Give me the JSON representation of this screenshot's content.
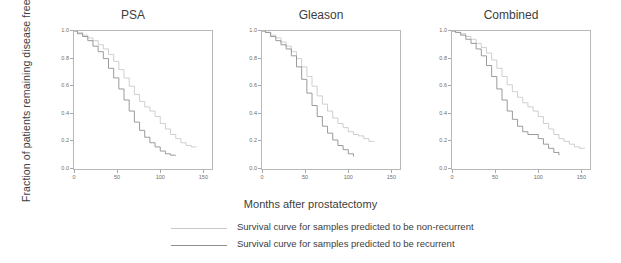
{
  "figure": {
    "ylabel": "Fraction of patients remaining disease free",
    "xlabel": "Months after prostatectomy"
  },
  "legend": {
    "entries": [
      {
        "label": "Survival curve for samples predicted to be non-recurrent",
        "color": "#c9c9c9",
        "key": "non-recurrent"
      },
      {
        "label": "Survival curve for samples predicted to be recurrent",
        "color": "#8e8e8e",
        "key": "recurrent"
      }
    ]
  },
  "chart_data": {
    "type": "line",
    "title": "",
    "xlabel": "Months after prostatectomy",
    "ylabel": "Fraction of patients remaining disease free",
    "xlim": [
      0,
      160
    ],
    "ylim": [
      0,
      1.0
    ],
    "xticks": [
      0,
      50,
      100,
      150
    ],
    "xticklabels": [
      "0",
      "50",
      "100",
      "150"
    ],
    "yticks": [
      0.0,
      0.2,
      0.4,
      0.6,
      0.8,
      1.0
    ],
    "yticklabels": [
      "0.0",
      "0.2",
      "0.4",
      "0.6",
      "0.8",
      "1.0"
    ],
    "grid": false,
    "legend_position": "bottom",
    "panels": [
      {
        "title": "PSA",
        "annotation": "p=0.0065937",
        "series": [
          {
            "name": "non-recurrent",
            "color": "#c9c9c9",
            "x": [
              0,
              4,
              10,
              16,
              22,
              28,
              34,
              40,
              46,
              52,
              58,
              64,
              70,
              76,
              82,
              88,
              94,
              100,
              106,
              112,
              118,
              124,
              130,
              136,
              142
            ],
            "y": [
              1.0,
              0.99,
              0.97,
              0.95,
              0.93,
              0.9,
              0.87,
              0.83,
              0.78,
              0.72,
              0.66,
              0.6,
              0.54,
              0.49,
              0.45,
              0.42,
              0.38,
              0.33,
              0.29,
              0.25,
              0.22,
              0.19,
              0.17,
              0.16,
              0.16
            ]
          },
          {
            "name": "recurrent",
            "color": "#8e8e8e",
            "x": [
              0,
              4,
              10,
              16,
              22,
              28,
              34,
              40,
              46,
              52,
              58,
              64,
              70,
              76,
              82,
              88,
              94,
              100,
              106,
              112,
              118
            ],
            "y": [
              1.0,
              0.98,
              0.96,
              0.93,
              0.89,
              0.85,
              0.8,
              0.73,
              0.66,
              0.58,
              0.5,
              0.42,
              0.34,
              0.28,
              0.23,
              0.19,
              0.16,
              0.13,
              0.11,
              0.1,
              0.1
            ]
          }
        ]
      },
      {
        "title": "Gleason",
        "annotation": "p=0.0095472",
        "series": [
          {
            "name": "non-recurrent",
            "color": "#c9c9c9",
            "x": [
              0,
              4,
              10,
              16,
              22,
              28,
              34,
              40,
              46,
              52,
              58,
              64,
              70,
              76,
              82,
              88,
              94,
              100,
              106,
              112,
              118,
              124,
              130
            ],
            "y": [
              1.0,
              0.99,
              0.97,
              0.95,
              0.92,
              0.89,
              0.85,
              0.8,
              0.74,
              0.67,
              0.6,
              0.53,
              0.47,
              0.42,
              0.37,
              0.33,
              0.3,
              0.27,
              0.25,
              0.24,
              0.22,
              0.2,
              0.2
            ]
          },
          {
            "name": "recurrent",
            "color": "#8e8e8e",
            "x": [
              0,
              4,
              10,
              16,
              22,
              28,
              34,
              40,
              46,
              52,
              58,
              64,
              70,
              76,
              82,
              88,
              94,
              100,
              106
            ],
            "y": [
              1.0,
              0.99,
              0.96,
              0.93,
              0.9,
              0.87,
              0.82,
              0.74,
              0.65,
              0.55,
              0.46,
              0.38,
              0.31,
              0.26,
              0.21,
              0.17,
              0.14,
              0.11,
              0.09
            ]
          }
        ]
      },
      {
        "title": "Combined",
        "annotation": "p=0.0191418",
        "series": [
          {
            "name": "non-recurrent",
            "color": "#c9c9c9",
            "x": [
              0,
              4,
              10,
              16,
              22,
              28,
              34,
              40,
              46,
              52,
              58,
              64,
              70,
              76,
              82,
              88,
              94,
              100,
              106,
              112,
              118,
              124,
              130,
              136,
              142,
              148,
              154
            ],
            "y": [
              1.0,
              0.99,
              0.98,
              0.96,
              0.94,
              0.91,
              0.88,
              0.84,
              0.79,
              0.73,
              0.67,
              0.61,
              0.56,
              0.52,
              0.48,
              0.45,
              0.42,
              0.38,
              0.33,
              0.29,
              0.25,
              0.22,
              0.2,
              0.18,
              0.16,
              0.15,
              0.15
            ]
          },
          {
            "name": "recurrent",
            "color": "#8e8e8e",
            "x": [
              0,
              4,
              10,
              16,
              22,
              28,
              34,
              40,
              46,
              52,
              58,
              64,
              70,
              76,
              82,
              88,
              94,
              100,
              106,
              112,
              118,
              124
            ],
            "y": [
              1.0,
              0.99,
              0.97,
              0.94,
              0.91,
              0.87,
              0.82,
              0.75,
              0.67,
              0.58,
              0.5,
              0.42,
              0.36,
              0.31,
              0.27,
              0.25,
              0.25,
              0.22,
              0.18,
              0.15,
              0.12,
              0.1
            ]
          }
        ]
      }
    ]
  }
}
